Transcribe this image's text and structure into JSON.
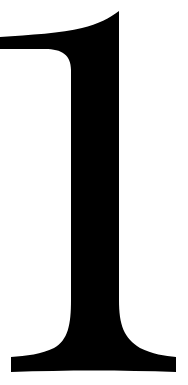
{
  "glyph": {
    "character": "1",
    "fill": "#000000",
    "background": "#ffffff"
  }
}
